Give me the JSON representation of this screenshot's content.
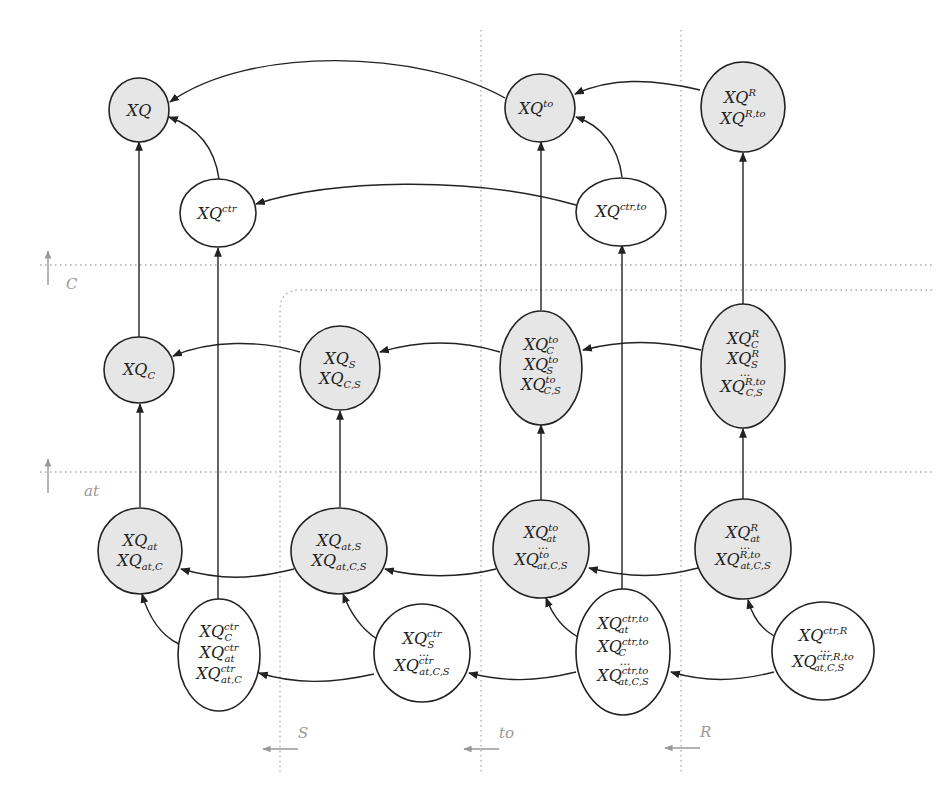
{
  "diagram": {
    "type": "lattice-of-query-rewritings",
    "dimensions": [
      {
        "id": "C",
        "label": "C",
        "orientation": "vertical-up"
      },
      {
        "id": "at",
        "label": "at",
        "orientation": "vertical-up"
      },
      {
        "id": "S",
        "label": "S",
        "orientation": "horizontal-left"
      },
      {
        "id": "to",
        "label": "to",
        "orientation": "horizontal-left"
      },
      {
        "id": "R",
        "label": "R",
        "orientation": "horizontal-left"
      }
    ],
    "nodes": [
      {
        "id": "XQ",
        "shaded": true,
        "lines": [
          {
            "base": "XQ",
            "sup": "",
            "sub": ""
          }
        ]
      },
      {
        "id": "XQto",
        "shaded": true,
        "lines": [
          {
            "base": "XQ",
            "sup": "to",
            "sub": ""
          }
        ]
      },
      {
        "id": "XQR",
        "shaded": true,
        "lines": [
          {
            "base": "XQ",
            "sup": "R",
            "sub": ""
          },
          {
            "base": "XQ",
            "sup": "R,to",
            "sub": ""
          }
        ]
      },
      {
        "id": "XQctr",
        "shaded": false,
        "lines": [
          {
            "base": "XQ",
            "sup": "ctr",
            "sub": ""
          }
        ]
      },
      {
        "id": "XQctrto",
        "shaded": false,
        "lines": [
          {
            "base": "XQ",
            "sup": "ctr,to",
            "sub": ""
          }
        ]
      },
      {
        "id": "XQC",
        "shaded": true,
        "lines": [
          {
            "base": "XQ",
            "sup": "",
            "sub": "C"
          }
        ]
      },
      {
        "id": "XQS",
        "shaded": true,
        "lines": [
          {
            "base": "XQ",
            "sup": "",
            "sub": "S"
          },
          {
            "base": "XQ",
            "sup": "",
            "sub": "C,S"
          }
        ]
      },
      {
        "id": "XQtoC",
        "shaded": true,
        "lines": [
          {
            "base": "XQ",
            "sup": "to",
            "sub": "C"
          },
          {
            "base": "XQ",
            "sup": "to",
            "sub": "S"
          },
          {
            "base": "XQ",
            "sup": "to",
            "sub": "C,S"
          }
        ]
      },
      {
        "id": "XQRC",
        "shaded": true,
        "lines": [
          {
            "base": "XQ",
            "sup": "R",
            "sub": "C"
          },
          {
            "base": "XQ",
            "sup": "R",
            "sub": "S"
          },
          {
            "dots": "..."
          },
          {
            "base": "XQ",
            "sup": "R,to",
            "sub": "C,S"
          }
        ]
      },
      {
        "id": "XQat",
        "shaded": true,
        "lines": [
          {
            "base": "XQ",
            "sup": "",
            "sub": "at"
          },
          {
            "base": "XQ",
            "sup": "",
            "sub": "at,C"
          }
        ]
      },
      {
        "id": "XQatS",
        "shaded": true,
        "lines": [
          {
            "base": "XQ",
            "sup": "",
            "sub": "at,S"
          },
          {
            "base": "XQ",
            "sup": "",
            "sub": "at,C,S"
          }
        ]
      },
      {
        "id": "XQtoat",
        "shaded": true,
        "lines": [
          {
            "base": "XQ",
            "sup": "to",
            "sub": "at"
          },
          {
            "dots": "..."
          },
          {
            "base": "XQ",
            "sup": "to",
            "sub": "at,C,S"
          }
        ]
      },
      {
        "id": "XQRat",
        "shaded": true,
        "lines": [
          {
            "base": "XQ",
            "sup": "R",
            "sub": "at"
          },
          {
            "dots": "..."
          },
          {
            "base": "XQ",
            "sup": "R,to",
            "sub": "at,C,S"
          }
        ]
      },
      {
        "id": "XQctrC",
        "shaded": false,
        "lines": [
          {
            "base": "XQ",
            "sup": "ctr",
            "sub": "C"
          },
          {
            "base": "XQ",
            "sup": "ctr",
            "sub": "at"
          },
          {
            "base": "XQ",
            "sup": "ctr",
            "sub": "at,C"
          }
        ]
      },
      {
        "id": "XQctrS",
        "shaded": false,
        "lines": [
          {
            "base": "XQ",
            "sup": "ctr",
            "sub": "S"
          },
          {
            "dots": "..."
          },
          {
            "base": "XQ",
            "sup": "ctr",
            "sub": "at,C,S"
          }
        ]
      },
      {
        "id": "XQctrtoat",
        "shaded": false,
        "lines": [
          {
            "base": "XQ",
            "sup": "ctr,to",
            "sub": "at"
          },
          {
            "base": "XQ",
            "sup": "ctr,to",
            "sub": "C"
          },
          {
            "dots": "..."
          },
          {
            "base": "XQ",
            "sup": "ctr,to",
            "sub": "at,C,S"
          }
        ]
      },
      {
        "id": "XQctrR",
        "shaded": false,
        "lines": [
          {
            "base": "XQ",
            "sup": "ctr,R",
            "sub": ""
          },
          {
            "dots": "..."
          },
          {
            "base": "XQ",
            "sup": "ctr,R,to",
            "sub": "at,C,S"
          }
        ]
      }
    ],
    "edges": [
      {
        "from": "XQto",
        "to": "XQ"
      },
      {
        "from": "XQctr",
        "to": "XQ"
      },
      {
        "from": "XQC",
        "to": "XQ"
      },
      {
        "from": "XQR",
        "to": "XQto"
      },
      {
        "from": "XQctrto",
        "to": "XQto"
      },
      {
        "from": "XQtoC",
        "to": "XQto"
      },
      {
        "from": "XQRC",
        "to": "XQR"
      },
      {
        "from": "XQctrto",
        "to": "XQctr"
      },
      {
        "from": "XQctrC",
        "to": "XQctr"
      },
      {
        "from": "XQctrtoat",
        "to": "XQctrto"
      },
      {
        "from": "XQS",
        "to": "XQC"
      },
      {
        "from": "XQat",
        "to": "XQC"
      },
      {
        "from": "XQtoC",
        "to": "XQS"
      },
      {
        "from": "XQatS",
        "to": "XQS"
      },
      {
        "from": "XQRC",
        "to": "XQtoC"
      },
      {
        "from": "XQtoat",
        "to": "XQtoC"
      },
      {
        "from": "XQRat",
        "to": "XQRC"
      },
      {
        "from": "XQatS",
        "to": "XQat"
      },
      {
        "from": "XQctrC",
        "to": "XQat"
      },
      {
        "from": "XQtoat",
        "to": "XQatS"
      },
      {
        "from": "XQctrS",
        "to": "XQatS"
      },
      {
        "from": "XQRat",
        "to": "XQtoat"
      },
      {
        "from": "XQctrtoat",
        "to": "XQtoat"
      },
      {
        "from": "XQctrR",
        "to": "XQRat"
      },
      {
        "from": "XQctrS",
        "to": "XQctrC"
      },
      {
        "from": "XQctrtoat",
        "to": "XQctrS"
      },
      {
        "from": "XQctrR",
        "to": "XQctrtoat"
      }
    ],
    "colors": {
      "shaded_fill": "#e6e6e6",
      "stroke": "#222222",
      "guide": "#aaaaaa"
    }
  }
}
